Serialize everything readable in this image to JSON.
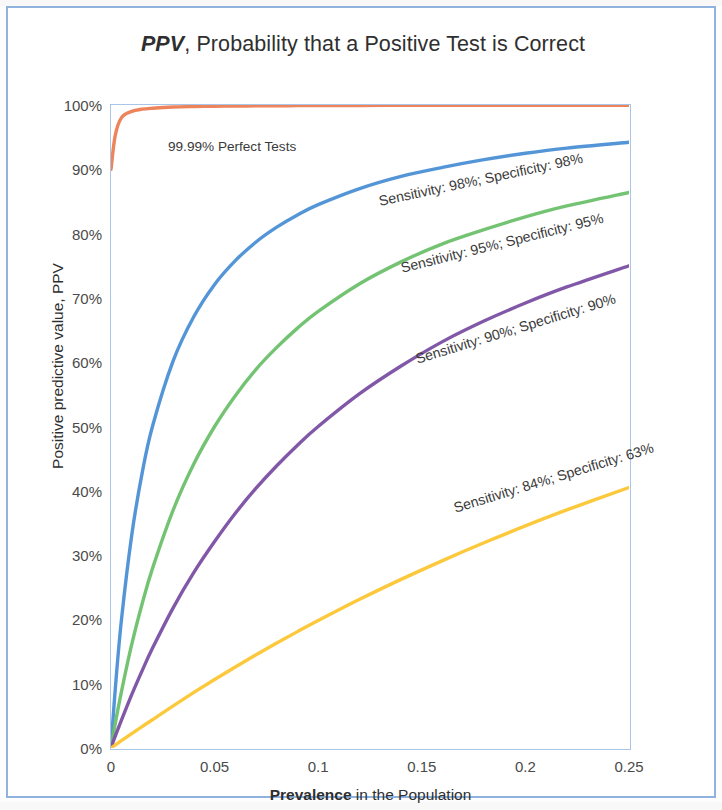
{
  "chart_data": {
    "type": "line",
    "title": "PPV, Probability that a Positive Test is Correct",
    "title_bold_italic_part": "PPV",
    "title_rest": ", Probability that a Positive Test is Correct",
    "xlabel": "Prevalence in the Population",
    "xlabel_bold_part": "Prevalence",
    "xlabel_rest": " in the Population",
    "ylabel": "Positive predictive value, PPV",
    "xlim": [
      0,
      0.25
    ],
    "ylim": [
      0,
      1.0
    ],
    "grid": false,
    "legend": "inline labels on curves",
    "xticks": [
      "0",
      "0.05",
      "0.1",
      "0.15",
      "0.2",
      "0.25"
    ],
    "xtick_values": [
      0,
      0.05,
      0.1,
      0.15,
      0.2,
      0.25
    ],
    "yticks": [
      "0%",
      "10%",
      "20%",
      "30%",
      "40%",
      "50%",
      "60%",
      "70%",
      "80%",
      "90%",
      "100%"
    ],
    "ytick_values": [
      0,
      0.1,
      0.2,
      0.3,
      0.4,
      0.5,
      0.6,
      0.7,
      0.8,
      0.9,
      1.0
    ],
    "x": [
      0,
      0.002,
      0.005,
      0.01,
      0.015,
      0.02,
      0.03,
      0.04,
      0.05,
      0.06,
      0.07,
      0.08,
      0.09,
      0.1,
      0.12,
      0.14,
      0.16,
      0.18,
      0.2,
      0.22,
      0.25
    ],
    "series": [
      {
        "name": "99.99% Perfect Tests",
        "label": "99.99% Perfect Tests",
        "color": "#ed7d52",
        "sensitivity": 0.9999,
        "specificity": 0.9999,
        "values": [
          0.9,
          0.952,
          0.98,
          0.99,
          0.9935,
          0.995,
          0.9968,
          0.9976,
          0.9981,
          0.9984,
          0.9986,
          0.9988,
          0.999,
          0.9991,
          0.9993,
          0.9994,
          0.9995,
          0.9995,
          0.9996,
          0.9996,
          0.9997
        ]
      },
      {
        "name": "Sensitivity: 98%; Specificity: 98%",
        "label": "Sensitivity: 98%; Specificity: 98%",
        "color": "#4a8fd4",
        "sensitivity": 0.98,
        "specificity": 0.98,
        "values": [
          0.0,
          0.089,
          0.198,
          0.331,
          0.427,
          0.5,
          0.602,
          0.671,
          0.721,
          0.758,
          0.787,
          0.81,
          0.829,
          0.845,
          0.87,
          0.889,
          0.903,
          0.915,
          0.925,
          0.933,
          0.942
        ]
      },
      {
        "name": "Sensitivity: 95%; Specificity: 95%",
        "label": "Sensitivity: 95%; Specificity: 95%",
        "color": "#6cc06c",
        "sensitivity": 0.95,
        "specificity": 0.95,
        "values": [
          0.0,
          0.037,
          0.087,
          0.161,
          0.224,
          0.279,
          0.37,
          0.442,
          0.5,
          0.548,
          0.589,
          0.623,
          0.653,
          0.679,
          0.722,
          0.756,
          0.784,
          0.806,
          0.826,
          0.843,
          0.864
        ]
      },
      {
        "name": "Sensitivity: 90%; Specificity: 90%",
        "label": "Sensitivity: 90%; Specificity: 90%",
        "color": "#7a4fa3",
        "sensitivity": 0.9,
        "specificity": 0.9,
        "values": [
          0.0,
          0.018,
          0.043,
          0.083,
          0.12,
          0.155,
          0.218,
          0.273,
          0.321,
          0.365,
          0.404,
          0.439,
          0.471,
          0.5,
          0.551,
          0.594,
          0.632,
          0.664,
          0.692,
          0.717,
          0.75
        ]
      },
      {
        "name": "Sensitivity: 84%; Specificity: 63%",
        "label": "Sensitivity: 84%; Specificity: 63%",
        "color": "#fcc531",
        "sensitivity": 0.84,
        "specificity": 0.63,
        "values": [
          0.0,
          0.0045,
          0.0113,
          0.0224,
          0.0333,
          0.044,
          0.0656,
          0.0864,
          0.1065,
          0.126,
          0.1449,
          0.1632,
          0.181,
          0.1982,
          0.2312,
          0.2622,
          0.2915,
          0.3192,
          0.3454,
          0.3702,
          0.4051
        ]
      }
    ],
    "annotations": [
      {
        "text": "99.99% Perfect Tests",
        "series": "99.99% Perfect Tests",
        "rotation_deg": 0
      },
      {
        "text": "Sensitivity: 98%; Specificity: 98%",
        "series": "Sensitivity: 98%; Specificity: 98%",
        "rotation_deg": -12
      },
      {
        "text": "Sensitivity: 95%; Specificity: 95%",
        "series": "Sensitivity: 95%; Specificity: 95%",
        "rotation_deg": -14
      },
      {
        "text": "Sensitivity: 90%; Specificity: 90%",
        "series": "Sensitivity: 90%; Specificity: 90%",
        "rotation_deg": -17
      },
      {
        "text": "Sensitivity: 84%; Specificity: 63%",
        "series": "Sensitivity: 84%; Specificity: 63%",
        "rotation_deg": -17
      }
    ]
  },
  "style": {
    "frame_border_color": "#8fb3de",
    "plot_border_color": "#a9c6e8",
    "text_color": "#2f2f2f",
    "tick_color": "#4a4a4a",
    "background": "#ffffff"
  }
}
